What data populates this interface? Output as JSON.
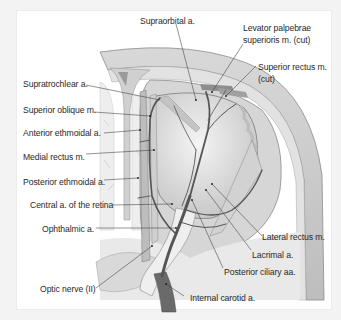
{
  "figure": {
    "colors": {
      "background": "#f3f3f3",
      "panel": "#ffffff",
      "bone": "#c9c9c9",
      "bone_dark": "#9a9a9a",
      "globe": "#e6e6e6",
      "artery": "#5a5a5a",
      "label_text": "#2a2a2a"
    }
  },
  "labels": {
    "supraorbital": "Supraorbital a.",
    "levator_1": "Levator palpebrae",
    "levator_2": "superioris m. (cut)",
    "superior_rectus_1": "Superior rectus m.",
    "superior_rectus_2": "(cut)",
    "supratrochlear": "Supratrochlear a.",
    "superior_oblique": "Superior oblique m.",
    "anterior_ethmoidal": "Anterior ethmoidal a.",
    "medial_rectus": "Medial rectus m.",
    "posterior_ethmoidal": "Posterior ethmoidal a.",
    "central_retina": "Central a. of the retina",
    "ophthalmic": "Ophthalmic a.",
    "optic_nerve": "Optic nerve (II)",
    "lateral_rectus": "Lateral rectus m.",
    "lacrimal": "Lacrimal a.",
    "posterior_ciliary": "Posterior ciliary aa.",
    "internal_carotid": "Internal carotid a."
  }
}
